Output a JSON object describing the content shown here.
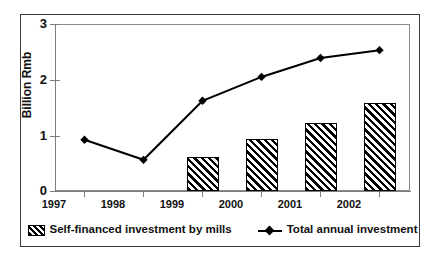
{
  "chart_data": {
    "type": "bar",
    "title": "",
    "xlabel": "",
    "ylabel": "Billion Rmb",
    "categories": [
      "1997",
      "1998",
      "1999",
      "2000",
      "2001",
      "2002"
    ],
    "ylim": [
      0,
      3
    ],
    "yticks": [
      "0",
      "1",
      "2",
      "3"
    ],
    "ytick_values": [
      0,
      1,
      2,
      3
    ],
    "grid": false,
    "legend_position": "bottom",
    "series": [
      {
        "name": "Self-financed investment by mills",
        "type": "bar",
        "style": "diagonal-hatch",
        "values": [
          null,
          null,
          0.61,
          0.93,
          1.22,
          1.58
        ]
      },
      {
        "name": "Total annual investment",
        "type": "line",
        "marker": "diamond",
        "color": "#000000",
        "values": [
          0.92,
          0.56,
          1.62,
          2.05,
          2.39,
          2.53
        ]
      }
    ]
  },
  "axis": {
    "y_title": "Billion Rmb",
    "y_tick_labels": [
      "3",
      "2",
      "1",
      "0"
    ],
    "x_tick_labels": [
      "1997",
      "1998",
      "1999",
      "2000",
      "2001",
      "2002"
    ]
  },
  "legend": {
    "entries": [
      {
        "label": "Self-financed investment by mills",
        "swatch": "hatched-bar-swatch"
      },
      {
        "label": "Total annual investment",
        "swatch": "diamond-line-swatch"
      }
    ]
  }
}
